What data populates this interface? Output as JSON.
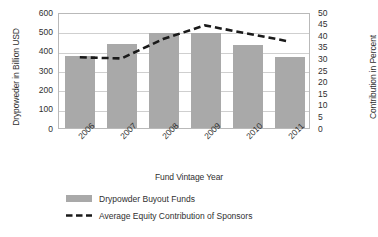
{
  "chart_data": {
    "type": "bar",
    "title": "",
    "xlabel": "Fund Vintage Year",
    "categories": [
      "2006",
      "2007",
      "2008",
      "2009",
      "2010",
      "2011"
    ],
    "grid": true,
    "legend_position": "bottom",
    "axes": {
      "left": {
        "label": "Drypoweder in Billion USD",
        "ticks": [
          "0",
          "100",
          "200",
          "300",
          "400",
          "500",
          "600"
        ],
        "tick_values": [
          0,
          100,
          200,
          300,
          400,
          500,
          600
        ],
        "lim": [
          0,
          600
        ]
      },
      "right": {
        "label": "Contribution in Percent",
        "ticks": [
          "0",
          "5",
          "10",
          "15",
          "20",
          "25",
          "30",
          "35",
          "40",
          "45",
          "50"
        ],
        "tick_values": [
          0,
          5,
          10,
          15,
          20,
          25,
          30,
          35,
          40,
          45,
          50
        ],
        "lim": [
          0,
          50
        ]
      }
    },
    "series": [
      {
        "name": "Drypowder Buyout Funds",
        "type": "bar",
        "axis": "left",
        "unit": "Billion USD",
        "color": "#a9a9a9",
        "values": [
          375,
          435,
          490,
          492,
          428,
          368
        ]
      },
      {
        "name": "Average Equity Contribution of Sponsors",
        "type": "line",
        "style": "dashed",
        "axis": "right",
        "unit": "Percent",
        "color": "#1a1a1a",
        "values": [
          31,
          30.5,
          39,
          45,
          41.5,
          38
        ]
      }
    ]
  },
  "legend": {
    "items": [
      {
        "label": "Drypowder Buyout Funds",
        "marker": "bar-swatch"
      },
      {
        "label": "Average Equity Contribution of Sponsors",
        "marker": "dashed-line"
      }
    ]
  }
}
